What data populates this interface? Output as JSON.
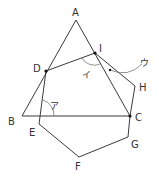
{
  "diagram": {
    "points": {
      "A": {
        "label": "A",
        "x": 76,
        "y": 20,
        "lx": 72,
        "ly": 16
      },
      "B": {
        "label": "B",
        "x": 22,
        "y": 116,
        "lx": 8,
        "ly": 125
      },
      "C": {
        "label": "C",
        "x": 130,
        "y": 116,
        "lx": 135,
        "ly": 121
      },
      "D": {
        "label": "D",
        "x": 46,
        "y": 71,
        "lx": 33,
        "ly": 72
      },
      "E": {
        "label": "E",
        "x": 39,
        "y": 124,
        "lx": 29,
        "ly": 136
      },
      "F": {
        "label": "F",
        "x": 79,
        "y": 157,
        "lx": 75,
        "ly": 170
      },
      "G": {
        "label": "G",
        "x": 128,
        "y": 137,
        "lx": 131,
        "ly": 148
      },
      "H": {
        "label": "H",
        "x": 135,
        "y": 86,
        "lx": 139,
        "ly": 91
      },
      "I": {
        "label": "I",
        "x": 95,
        "y": 53,
        "lx": 99,
        "ly": 52
      }
    },
    "angle_labels": {
      "a": {
        "label": "ア",
        "x": 50,
        "y": 109
      },
      "i": {
        "label": "イ",
        "x": 82,
        "y": 78
      },
      "u": {
        "label": "ウ",
        "x": 140,
        "y": 66
      }
    }
  }
}
